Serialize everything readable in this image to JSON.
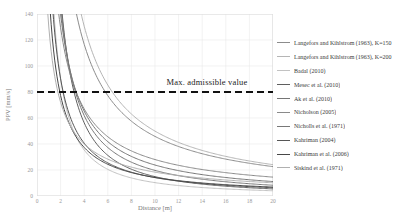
{
  "chart_data": {
    "type": "line",
    "title": "",
    "xlabel": "Distance [m]",
    "ylabel": "PPV [mm/s]",
    "xlim": [
      0,
      20
    ],
    "ylim": [
      0,
      140
    ],
    "x_ticks": [
      0,
      2,
      4,
      6,
      8,
      10,
      12,
      14,
      16,
      18,
      20
    ],
    "y_ticks": [
      0,
      20,
      40,
      60,
      80,
      100,
      120,
      140
    ],
    "grid": true,
    "grid_color": "#e9e9e9",
    "frame_color": "#dddddd",
    "legend_position": "right",
    "threshold": {
      "value": 80,
      "label": "Max. admissible value",
      "style": "dashed",
      "color": "#111111"
    },
    "series": [
      {
        "name": "Langefors and Kihlstrom (1963), K=150",
        "color": "#8c8c8c",
        "model": "power",
        "A": 480,
        "b": 1.02
      },
      {
        "name": "Langefors and Kihlstrom (1963), K=200",
        "color": "#b5b5b5",
        "model": "power",
        "A": 560,
        "b": 1.05
      },
      {
        "name": "Badal (2010)",
        "color": "#c2c2c2",
        "model": "power",
        "A": 230,
        "b": 1.35
      },
      {
        "name": "Mesec et al. (2010)",
        "color": "#5f5f5f",
        "model": "power",
        "A": 420,
        "b": 1.45
      },
      {
        "name": "Ak et al. (2010)",
        "color": "#757575",
        "model": "power",
        "A": 300,
        "b": 1.1
      },
      {
        "name": "Nicholson (2005)",
        "color": "#8a8a8a",
        "model": "power",
        "A": 250,
        "b": 0.95
      },
      {
        "name": "Nicholls et al. (1971)",
        "color": "#787878",
        "model": "power",
        "A": 350,
        "b": 1.25
      },
      {
        "name": "Kahriman (2004)",
        "color": "#565656",
        "model": "power",
        "A": 200,
        "b": 1.15
      },
      {
        "name": "Kahriman et al. (2006)",
        "color": "#474747",
        "model": "power",
        "A": 160,
        "b": 1.05
      },
      {
        "name": "Siskind et al. (1971)",
        "color": "#b0b0b0",
        "model": "power",
        "A": 130,
        "b": 0.85
      }
    ]
  }
}
